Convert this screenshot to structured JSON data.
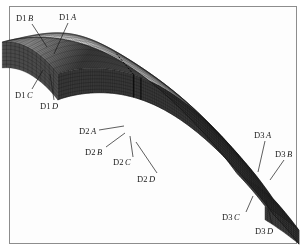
{
  "figure": {
    "kind": "finite-element-mesh-3d",
    "background_color": "#ffffff",
    "frame_color": "#8d8d8d",
    "mesh_color_dark": "#2a2a2a",
    "mesh_color_mid": "#555555",
    "mesh_color_light": "#8a8a8a",
    "label_color": "#1a1a1a"
  },
  "labels": [
    {
      "id": "d1-b",
      "prefix": "D1",
      "suffix": "B",
      "x": 16,
      "y": 14,
      "leader": [
        [
          32,
          24
        ],
        [
          47,
          47
        ]
      ]
    },
    {
      "id": "d1-a",
      "prefix": "D1",
      "suffix": "A",
      "x": 59,
      "y": 13,
      "leader": [
        [
          68,
          23
        ],
        [
          54,
          54
        ]
      ]
    },
    {
      "id": "d1-c",
      "prefix": "D1",
      "suffix": "C",
      "x": 15,
      "y": 91,
      "leader": [
        [
          32,
          89
        ],
        [
          43,
          70
        ]
      ]
    },
    {
      "id": "d1-d",
      "prefix": "D1",
      "suffix": "D",
      "x": 40,
      "y": 102,
      "leader": [
        [
          54,
          100
        ],
        [
          50,
          74
        ]
      ]
    },
    {
      "id": "d2-a",
      "prefix": "D2",
      "suffix": "A",
      "x": 79,
      "y": 127,
      "leader": [
        [
          99,
          130
        ],
        [
          124,
          126
        ]
      ]
    },
    {
      "id": "d2-b",
      "prefix": "D2",
      "suffix": "B",
      "x": 85,
      "y": 148,
      "leader": [
        [
          106,
          147
        ],
        [
          125,
          133
        ]
      ]
    },
    {
      "id": "d2-c",
      "prefix": "D2",
      "suffix": "C",
      "x": 113,
      "y": 158,
      "leader": [
        [
          133,
          157
        ],
        [
          130,
          136
        ]
      ]
    },
    {
      "id": "d2-d",
      "prefix": "D2",
      "suffix": "D",
      "x": 137,
      "y": 175,
      "leader": [
        [
          157,
          173
        ],
        [
          136,
          142
        ]
      ]
    },
    {
      "id": "d3-a",
      "prefix": "D3",
      "suffix": "A",
      "x": 254,
      "y": 131,
      "leader": [
        [
          265,
          141
        ],
        [
          258,
          172
        ]
      ]
    },
    {
      "id": "d3-b",
      "prefix": "D3",
      "suffix": "B",
      "x": 275,
      "y": 150,
      "leader": [
        [
          284,
          160
        ],
        [
          270,
          180
        ]
      ]
    },
    {
      "id": "d3-c",
      "prefix": "D3",
      "suffix": "C",
      "x": 222,
      "y": 213,
      "leader": [
        [
          246,
          212
        ],
        [
          253,
          196
        ]
      ]
    },
    {
      "id": "d3-d",
      "prefix": "D3",
      "suffix": "D",
      "x": 255,
      "y": 227,
      "leader": [
        [
          272,
          224
        ],
        [
          266,
          200
        ]
      ]
    }
  ]
}
